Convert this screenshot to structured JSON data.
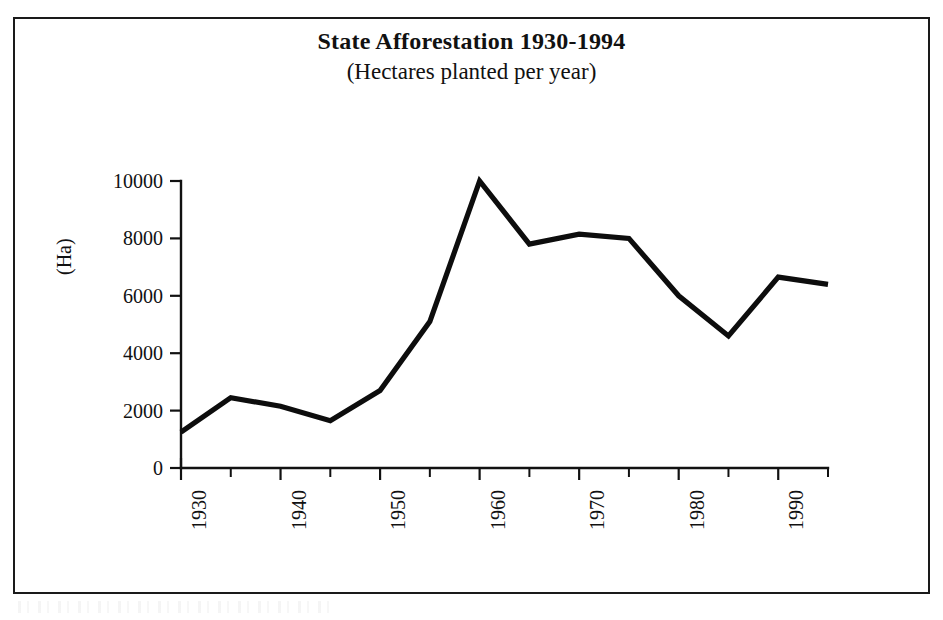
{
  "document": {
    "kind": "scanned-figure",
    "background_color": "#ffffff",
    "frame_color": "#1a1a1a",
    "ink_color": "#0d0d0d"
  },
  "chart_data": {
    "type": "line",
    "title": "State Afforestation 1930-1994",
    "subtitle": "(Hectares planted per year)",
    "xlabel": "",
    "ylabel": "(Ha)",
    "xlim": [
      1930,
      1995
    ],
    "ylim": [
      0,
      10000
    ],
    "grid": false,
    "legend": "none",
    "y_ticks": [
      0,
      2000,
      4000,
      6000,
      8000,
      10000
    ],
    "y_tick_labels": [
      "0",
      "2000",
      "4000",
      "6000",
      "8000",
      "10000"
    ],
    "x_ticks": [
      1930,
      1935,
      1940,
      1945,
      1950,
      1955,
      1960,
      1965,
      1970,
      1975,
      1980,
      1985,
      1990,
      1995
    ],
    "x_tick_labels_shown": [
      "1930",
      "1940",
      "1950",
      "1960",
      "1970",
      "1980",
      "1990"
    ],
    "x_labelled_ticks": [
      1930,
      1940,
      1950,
      1960,
      1970,
      1980,
      1990
    ],
    "x_tick_label_rotation": -90,
    "x": [
      1930,
      1935,
      1940,
      1945,
      1950,
      1955,
      1960,
      1965,
      1970,
      1975,
      1980,
      1985,
      1990,
      1995
    ],
    "values": [
      1250,
      2450,
      2150,
      1650,
      2700,
      5100,
      10000,
      7800,
      8150,
      8000,
      6000,
      4600,
      6650,
      6400
    ],
    "series": [
      {
        "name": "Hectares planted per year",
        "color": "#0d0d0d",
        "line_width": 5,
        "marker": "none",
        "values": [
          1250,
          2450,
          2150,
          1650,
          2700,
          5100,
          10000,
          7800,
          8150,
          8000,
          6000,
          4600,
          6650,
          6400
        ]
      }
    ],
    "annotations": []
  }
}
